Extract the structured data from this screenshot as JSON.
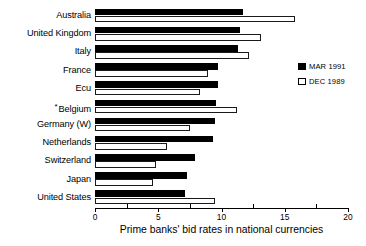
{
  "chart_data": {
    "type": "bar",
    "orientation": "horizontal",
    "title": "",
    "xlabel": "Prime banks' bid rates in national currencies",
    "ylabel": "",
    "xlim": [
      0,
      20
    ],
    "xticks": [
      0,
      5,
      10,
      15,
      20
    ],
    "xtick_labels": [
      "0",
      "5",
      "10",
      "15",
      "20"
    ],
    "minor_tick_step": 2.5,
    "grid": false,
    "legend_position": "right",
    "categories": [
      "Australia",
      "United Kingdom",
      "Italy",
      "France",
      "Ecu",
      "Belgium",
      "Germany (W)",
      "Netherlands",
      "Switzerland",
      "Japan",
      "United States"
    ],
    "category_notes": {
      "Belgium": "*"
    },
    "series": [
      {
        "name": "MAR 1991",
        "color": "#000000",
        "fill": "solid",
        "values": [
          11.7,
          11.5,
          11.3,
          9.7,
          9.7,
          9.6,
          9.5,
          9.3,
          7.9,
          7.3,
          7.1
        ]
      },
      {
        "name": "DEC 1989",
        "color": "#ffffff",
        "fill": "open",
        "values": [
          15.8,
          13.1,
          12.2,
          8.9,
          8.3,
          11.2,
          7.5,
          5.7,
          4.8,
          4.6,
          9.5
        ]
      }
    ]
  },
  "legend": {
    "entries": [
      {
        "label": "MAR 1991",
        "swatch": "filled-black-square"
      },
      {
        "label": "DEC 1989",
        "swatch": "open-white-square"
      }
    ]
  }
}
